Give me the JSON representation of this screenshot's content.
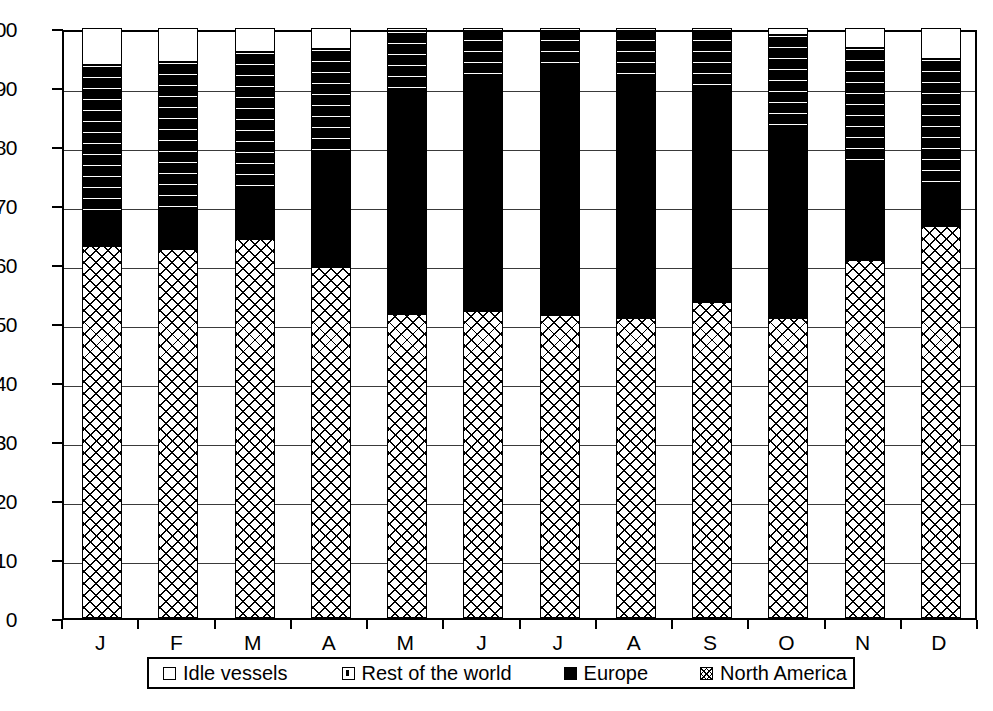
{
  "chart_data": {
    "type": "bar",
    "stacked": true,
    "title": "",
    "subtitle": "",
    "xlabel": "",
    "ylabel": "",
    "categories": [
      "J",
      "F",
      "M",
      "A",
      "M",
      "J",
      "J",
      "A",
      "S",
      "O",
      "N",
      "D"
    ],
    "category_names": [
      "January",
      "February",
      "March",
      "April",
      "May",
      "June",
      "July",
      "August",
      "September",
      "October",
      "November",
      "December"
    ],
    "ylim": [
      0,
      100
    ],
    "yticks": [
      0,
      10,
      20,
      30,
      40,
      50,
      60,
      70,
      80,
      90,
      100
    ],
    "ytick_labels": [
      "0",
      "10",
      "20",
      "30",
      "40",
      "50",
      "60",
      "70",
      "80",
      "90",
      "100"
    ],
    "grid": true,
    "grid_axis": "y",
    "legend_position": "bottom",
    "stack_order_bottom_to_top": [
      "North America",
      "Europe",
      "Rest of the world",
      "Idle vessels"
    ],
    "series": [
      {
        "name": "North America",
        "pattern": "cross-hatch",
        "values": [
          63.0,
          62.5,
          64.2,
          59.5,
          51.5,
          52.0,
          51.3,
          50.8,
          53.5,
          50.8,
          60.6,
          66.5
        ]
      },
      {
        "name": "Europe",
        "pattern": "solid-black",
        "values": [
          5.0,
          5.3,
          8.0,
          19.3,
          37.5,
          39.8,
          41.0,
          40.5,
          35.7,
          32.6,
          16.8,
          6.9
        ]
      },
      {
        "name": "Rest of the world",
        "pattern": "dashed-dots",
        "values": [
          25.8,
          26.4,
          23.8,
          17.7,
          10.5,
          8.2,
          7.7,
          8.7,
          10.8,
          15.4,
          19.2,
          21.4
        ]
      },
      {
        "name": "Idle vessels",
        "pattern": "white",
        "values": [
          6.2,
          5.8,
          4.0,
          3.5,
          0.5,
          0.0,
          0.0,
          0.0,
          0.0,
          1.2,
          3.4,
          5.2
        ]
      }
    ],
    "cumulative_tops": {
      "North America": [
        63.0,
        62.5,
        64.2,
        59.5,
        51.5,
        52.0,
        51.3,
        50.8,
        53.5,
        50.8,
        60.6,
        66.5
      ],
      "Europe": [
        68.0,
        67.8,
        72.2,
        78.8,
        89.0,
        91.8,
        92.3,
        91.3,
        89.2,
        83.4,
        77.4,
        73.4
      ],
      "Rest of the world": [
        93.8,
        94.2,
        96.0,
        96.5,
        99.5,
        100.0,
        100.0,
        100.0,
        100.0,
        98.8,
        96.6,
        94.8
      ],
      "Idle vessels": [
        100,
        100,
        100,
        100,
        100,
        100,
        100,
        100,
        100,
        100,
        100,
        100
      ]
    }
  },
  "legend": {
    "items": [
      {
        "label": "Idle vessels",
        "swatch": "white-square-icon"
      },
      {
        "label": "Rest of the world",
        "swatch": "dashed-square-icon"
      },
      {
        "label": "Europe",
        "swatch": "black-square-icon"
      },
      {
        "label": "North America",
        "swatch": "crosshatch-square-icon"
      }
    ]
  },
  "colors": {
    "axis": "#000000",
    "gridline": "#3a3a3a",
    "europe_fill": "#000000",
    "plot_background": "#ffffff"
  },
  "caption": {
    "text": ""
  }
}
